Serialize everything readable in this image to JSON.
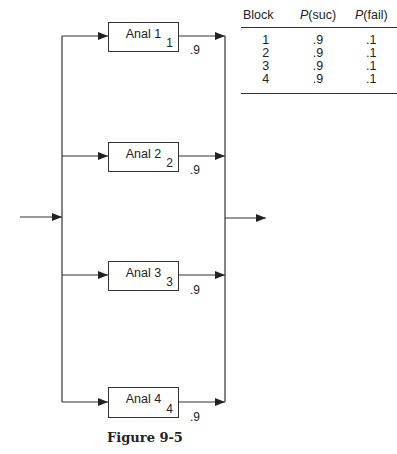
{
  "diagram": {
    "blocks": [
      {
        "label": "Anal 1",
        "number": "1",
        "probability": ".9"
      },
      {
        "label": "Anal 2",
        "number": "2",
        "probability": ".9"
      },
      {
        "label": "Anal 3",
        "number": "3",
        "probability": ".9"
      },
      {
        "label": "Anal 4",
        "number": "4",
        "probability": ".9"
      }
    ],
    "caption": "Figure 9-5"
  },
  "table": {
    "headers": [
      "Block",
      "P(suc)",
      "P(fail)"
    ],
    "rows": [
      [
        "1",
        ".9",
        ".1"
      ],
      [
        "2",
        ".9",
        ".1"
      ],
      [
        "3",
        ".9",
        ".1"
      ],
      [
        "4",
        ".9",
        ".1"
      ]
    ]
  }
}
